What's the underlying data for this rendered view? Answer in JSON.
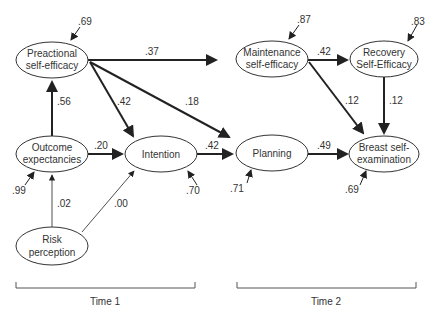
{
  "nodes": {
    "preactional": {
      "line1": "Preactional",
      "line2": "self-efficacy",
      "residual": ".69"
    },
    "outcome": {
      "line1": "Outcome",
      "line2": "expectancies",
      "residual": ".99"
    },
    "risk": {
      "line1": "Risk",
      "line2": "perception"
    },
    "intention": {
      "line1": "Intention",
      "residual": ".70"
    },
    "planning": {
      "line1": "Planning",
      "residual": ".71"
    },
    "maintenance": {
      "line1": "Maintenance",
      "line2": "self-efficacy",
      "residual": ".87"
    },
    "recovery": {
      "line1": "Recovery",
      "line2": "Self-Efficacy",
      "residual": ".83"
    },
    "bse": {
      "line1": "Breast self-",
      "line2": "examination",
      "residual": ".69"
    }
  },
  "paths": {
    "outcome_preactional": ".56",
    "preactional_maintenance": ".37",
    "preactional_intention": ".42",
    "preactional_planning": ".18",
    "outcome_intention": ".20",
    "intention_planning": ".42",
    "planning_bse": ".49",
    "maintenance_recovery": ".42",
    "maintenance_bse": ".12",
    "recovery_bse": ".12",
    "risk_outcome": ".02",
    "risk_intention": ".00"
  },
  "time_labels": {
    "time1": "Time 1",
    "time2": "Time 2"
  }
}
